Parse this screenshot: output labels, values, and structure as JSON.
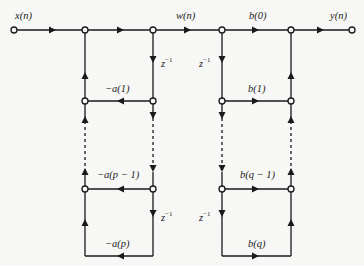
{
  "diagram": {
    "colors": {
      "line": "#1a1a1a",
      "background": "#f7f7f5",
      "text": "#222222"
    },
    "signals": {
      "input": "x(n)",
      "intermediate": "w(n)",
      "output": "y(n)"
    },
    "delay": {
      "base": "z",
      "exp": "−1"
    },
    "feedback_gains": {
      "first": "−a(1)",
      "second_last": "−a(p − 1)",
      "last": "−a(p)"
    },
    "feedforward_gains": {
      "zero": "b(0)",
      "first": "b(1)",
      "second_last": "b(q − 1)",
      "last": "b(q)"
    },
    "nodes": [
      {
        "id": "input",
        "x": 14,
        "y": 30
      },
      {
        "id": "sum-feedback",
        "x": 85,
        "y": 30
      },
      {
        "id": "w-node",
        "x": 153,
        "y": 30
      },
      {
        "id": "w-copy",
        "x": 222,
        "y": 30
      },
      {
        "id": "sum-output",
        "x": 291,
        "y": 30
      },
      {
        "id": "output",
        "x": 352,
        "y": 30
      },
      {
        "id": "fb-sum-1",
        "x": 85,
        "y": 101
      },
      {
        "id": "delay-1",
        "x": 153,
        "y": 101
      },
      {
        "id": "ff-delay-1",
        "x": 222,
        "y": 101
      },
      {
        "id": "ff-sum-1",
        "x": 291,
        "y": 101
      },
      {
        "id": "fb-sum-p1",
        "x": 85,
        "y": 189
      },
      {
        "id": "delay-p1",
        "x": 153,
        "y": 189
      },
      {
        "id": "ff-delay-q1",
        "x": 222,
        "y": 189
      },
      {
        "id": "ff-sum-q1",
        "x": 291,
        "y": 189
      }
    ]
  }
}
